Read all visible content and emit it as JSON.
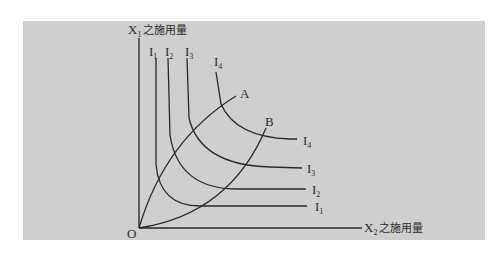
{
  "diagram": {
    "y_axis_label": {
      "main": "X",
      "sub": "1",
      "suffix": "之施用量"
    },
    "x_axis_label": {
      "main": "X",
      "sub": "2",
      "suffix": "之施用量"
    },
    "origin_label": "O",
    "curves": [
      {
        "id": "I1",
        "main": "I",
        "sub": "1"
      },
      {
        "id": "I2",
        "main": "I",
        "sub": "2"
      },
      {
        "id": "I3",
        "main": "I",
        "sub": "3"
      },
      {
        "id": "I4",
        "main": "I",
        "sub": "4"
      }
    ],
    "expansion_paths": [
      "A",
      "B"
    ],
    "colors": {
      "panel": "#cfcfcf",
      "line": "#2a2a2a",
      "background": "#ffffff"
    }
  }
}
